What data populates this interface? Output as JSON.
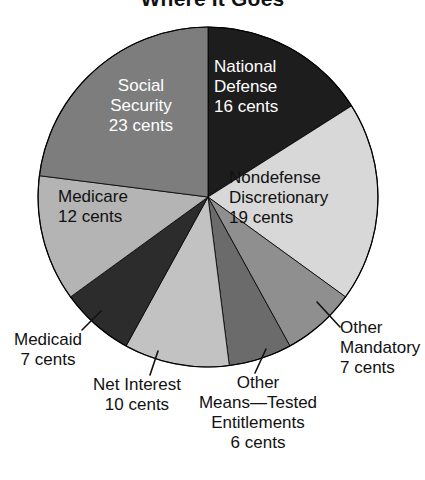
{
  "chart_data": {
    "type": "pie",
    "title": "Where It Goes",
    "unit": "cents",
    "total": 100,
    "categories": [
      "National Defense",
      "Nondefense Discretionary",
      "Other Mandatory",
      "Other Means—Tested Entitlements",
      "Net Interest",
      "Medicaid",
      "Medicare",
      "Social Security"
    ],
    "values": [
      16,
      19,
      7,
      6,
      10,
      7,
      12,
      23
    ],
    "colors": [
      "#1d1d1d",
      "#d8d8d8",
      "#8f8f8f",
      "#6b6b6b",
      "#c2c2c2",
      "#2c2c2c",
      "#b4b4b4",
      "#7d7d7d"
    ],
    "legend": "none",
    "grid": false,
    "start_angle_deg": 0,
    "direction": "clockwise",
    "slices": [
      {
        "label": "National Defense",
        "value": 16,
        "value_text": "16 cents",
        "color": "#1d1d1d",
        "label_placement": "inside",
        "text_color": "white"
      },
      {
        "label": "Nondefense Discretionary",
        "value": 19,
        "value_text": "19 cents",
        "color": "#d8d8d8",
        "label_placement": "inside",
        "text_color": "black"
      },
      {
        "label": "Other Mandatory",
        "value": 7,
        "value_text": "7 cents",
        "color": "#8f8f8f",
        "label_placement": "outside",
        "text_color": "black"
      },
      {
        "label": "Other Means—Tested Entitlements",
        "value": 6,
        "value_text": "6 cents",
        "color": "#6b6b6b",
        "label_placement": "outside",
        "text_color": "black"
      },
      {
        "label": "Net Interest",
        "value": 10,
        "value_text": "10 cents",
        "color": "#c2c2c2",
        "label_placement": "outside",
        "text_color": "black"
      },
      {
        "label": "Medicaid",
        "value": 7,
        "value_text": "7 cents",
        "color": "#2c2c2c",
        "label_placement": "outside",
        "text_color": "black"
      },
      {
        "label": "Medicare",
        "value": 12,
        "value_text": "12 cents",
        "color": "#b4b4b4",
        "label_placement": "inside",
        "text_color": "black"
      },
      {
        "label": "Social Security",
        "value": 23,
        "value_text": "23 cents",
        "color": "#7d7d7d",
        "label_placement": "inside",
        "text_color": "white"
      }
    ]
  },
  "title": "Where It Goes",
  "labels": {
    "national_defense": {
      "name_line1": "National",
      "name_line2": "Defense",
      "value": "16 cents"
    },
    "nondefense_discretionary": {
      "name_line1": "Nondefense",
      "name_line2": "Discretionary",
      "value": "19 cents"
    },
    "other_mandatory": {
      "name_line1": "Other",
      "name_line2": "Mandatory",
      "value": "7 cents"
    },
    "other_means_tested": {
      "name_line1": "Other",
      "name_line2": "Means—Tested",
      "name_line3": "Entitlements",
      "value": "6 cents"
    },
    "net_interest": {
      "name_line1": "Net Interest",
      "value": "10 cents"
    },
    "medicaid": {
      "name_line1": "Medicaid",
      "value": "7 cents"
    },
    "medicare": {
      "name_line1": "Medicare",
      "value": "12 cents"
    },
    "social_security": {
      "name_line1": "Social",
      "name_line2": "Security",
      "value": "23 cents"
    }
  }
}
